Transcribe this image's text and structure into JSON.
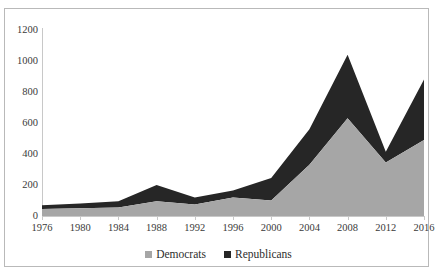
{
  "chart_data": {
    "type": "area",
    "stacked": true,
    "title": "",
    "xlabel": "",
    "ylabel": "",
    "categories": [
      1976,
      1980,
      1984,
      1988,
      1992,
      1996,
      2000,
      2004,
      2008,
      2012,
      2016
    ],
    "xticklabels": [
      "1976",
      "1980",
      "1984",
      "1988",
      "1992",
      "1996",
      "2000",
      "2004",
      "2008",
      "2012",
      "2016"
    ],
    "yticklabels": [
      "0",
      "200",
      "400",
      "600",
      "800",
      "1000",
      "1200"
    ],
    "yticks": [
      0,
      200,
      400,
      600,
      800,
      1000,
      1200
    ],
    "ylim": [
      0,
      1200
    ],
    "grid": false,
    "legend_position": "bottom",
    "series": [
      {
        "name": "Democrats",
        "color": "#a6a6a6",
        "values": [
          45,
          50,
          55,
          95,
          75,
          120,
          100,
          330,
          630,
          345,
          490
        ]
      },
      {
        "name": "Republicans",
        "color": "#262626",
        "values": [
          25,
          30,
          40,
          105,
          45,
          45,
          145,
          230,
          410,
          70,
          390
        ]
      }
    ],
    "totals": [
      70,
      80,
      95,
      200,
      120,
      165,
      245,
      560,
      1040,
      415,
      880
    ]
  },
  "legend": {
    "items": [
      {
        "label": "Democrats",
        "color": "#a6a6a6",
        "marker": "square-marker"
      },
      {
        "label": "Republicans",
        "color": "#262626",
        "marker": "square-marker"
      }
    ]
  },
  "axes": {
    "border_color": "#b9b9b9",
    "axis_color": "#c8c8c8",
    "tick_text_color": "#3a3a3a"
  }
}
